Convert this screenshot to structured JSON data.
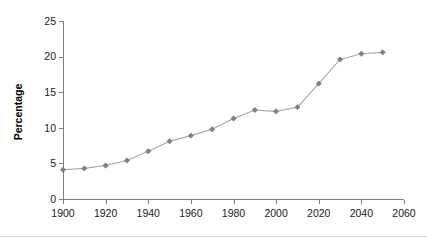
{
  "chart_data": {
    "type": "line",
    "title": "",
    "subtitle": "",
    "xlabel": "",
    "ylabel": "Percentage",
    "xlim": [
      1900,
      2060
    ],
    "ylim": [
      0,
      25
    ],
    "grid": false,
    "legend": "none",
    "x_ticks": [
      1900,
      1920,
      1940,
      1960,
      1980,
      2000,
      2020,
      2040,
      2060
    ],
    "y_ticks": [
      0,
      5,
      10,
      15,
      20,
      25
    ],
    "x_tick_labels": [
      "1900",
      "1920",
      "1940",
      "1960",
      "1980",
      "2000",
      "2020",
      "2040",
      "2060"
    ],
    "y_tick_labels": [
      "0",
      "5",
      "10",
      "15",
      "20",
      "25"
    ],
    "marker": "diamond",
    "series": [
      {
        "name": "Percentage",
        "color": "#808080",
        "x": [
          1900,
          1910,
          1920,
          1930,
          1940,
          1950,
          1960,
          1970,
          1980,
          1990,
          2000,
          2010,
          2020,
          2030,
          2040,
          2050
        ],
        "values": [
          4.1,
          4.3,
          4.7,
          5.4,
          6.7,
          8.1,
          8.9,
          9.8,
          11.3,
          12.5,
          12.3,
          12.9,
          16.2,
          19.6,
          20.4,
          20.6
        ]
      }
    ]
  },
  "colors": {
    "line": "#a6a6a6",
    "marker": "#808080",
    "axis": "#7f7f7f",
    "text": "#1a1a1a",
    "background": "#ffffff",
    "rule": "#d9d9d9"
  }
}
